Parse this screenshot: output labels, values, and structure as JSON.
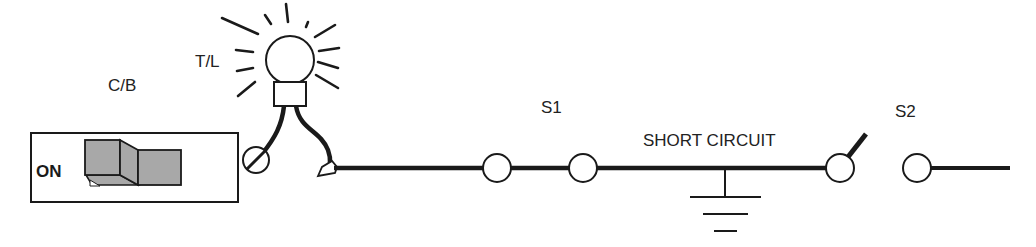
{
  "diagram": {
    "type": "electrical-circuit",
    "title": "",
    "colors": {
      "line": "#1a1a1a",
      "switch_fill": "#a8a8a8",
      "background": "#ffffff"
    },
    "components": {
      "circuit_breaker": {
        "label": "C/B",
        "state_label": "ON"
      },
      "test_light": {
        "label": "T/L"
      },
      "connector_1": {
        "label": "S1"
      },
      "fault": {
        "label": "SHORT CIRCUIT"
      },
      "connector_2": {
        "label": "S2"
      }
    }
  }
}
